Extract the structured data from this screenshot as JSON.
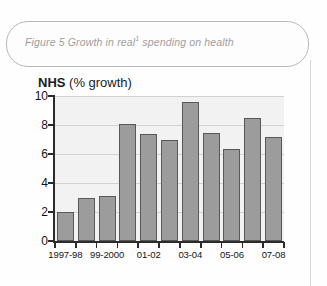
{
  "figure": {
    "caption_prefix": "Figure 5 Growth in real",
    "caption_footnote_marker": "1",
    "caption_suffix": " spending on health"
  },
  "chart_data": {
    "type": "bar",
    "title": "NHS (% growth)",
    "title_bold_part": "NHS",
    "title_regular_part": " (% growth)",
    "xlabel": "",
    "ylabel": "",
    "ylim": [
      0,
      10
    ],
    "grid": true,
    "legend": "none",
    "yticks": [
      0,
      2,
      4,
      6,
      8,
      10
    ],
    "ytick_labels": [
      "0",
      "2",
      "4",
      "6",
      "8",
      "10"
    ],
    "categories": [
      "1997-98",
      "1998-99",
      "99-2000",
      "2000-01",
      "01-02",
      "02-03",
      "03-04",
      "04-05",
      "05-06",
      "06-07",
      "07-08"
    ],
    "tick_labels_shown": [
      "1997-98",
      "99-2000",
      "01-02",
      "03-04",
      "05-06",
      "07-08"
    ],
    "values": [
      2.0,
      3.0,
      3.1,
      8.1,
      7.4,
      7.0,
      9.6,
      7.45,
      6.35,
      8.5,
      7.2
    ],
    "bar_color": "#9c9c9c",
    "bar_edge_color": "#585858",
    "plot_background": "#f2f2f2",
    "gridline_color": "#d2d2d2",
    "axis_color": "#2b2b2b"
  }
}
